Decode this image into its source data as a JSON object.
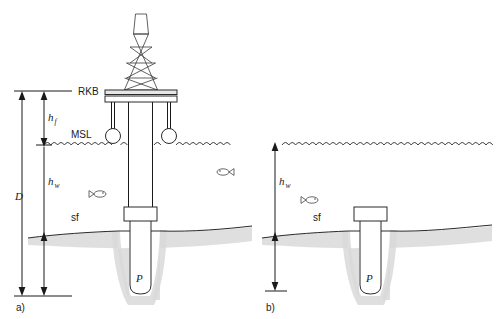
{
  "figure": {
    "panels": [
      {
        "tag": "a)",
        "kind": "surface-platform",
        "labels": {
          "rkb": "RKB",
          "msl": "MSL",
          "seafloor": "sf",
          "reservoir": "P"
        },
        "dimensions": [
          {
            "symbol": "D",
            "subscript": "",
            "from": "RKB",
            "to": "bottom-datum"
          },
          {
            "symbol": "h",
            "subscript": "f",
            "from": "RKB",
            "to": "MSL"
          },
          {
            "symbol": "h",
            "subscript": "w",
            "from": "MSL",
            "to": "bottom-datum"
          }
        ]
      },
      {
        "tag": "b)",
        "kind": "subsea-wellhead",
        "labels": {
          "seafloor": "sf",
          "reservoir": "P"
        },
        "dimensions": [
          {
            "symbol": "h",
            "subscript": "w",
            "from": "sea-surface",
            "to": "bottom-datum"
          }
        ]
      }
    ],
    "colors": {
      "line": "#1a1a1a",
      "seabed": "#d9d9d9",
      "deck": "#e6e6e6",
      "background": "#ffffff"
    }
  }
}
